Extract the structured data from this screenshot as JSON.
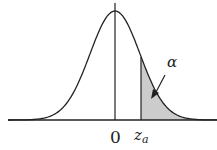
{
  "diagram": {
    "type": "normal-distribution-upper-tail",
    "labels": {
      "origin": "0",
      "critical_value": "z",
      "critical_value_subscript": "a",
      "area": "α"
    },
    "colors": {
      "curve": "#222222",
      "shade": "#cccccc",
      "background": "#ffffff"
    }
  }
}
